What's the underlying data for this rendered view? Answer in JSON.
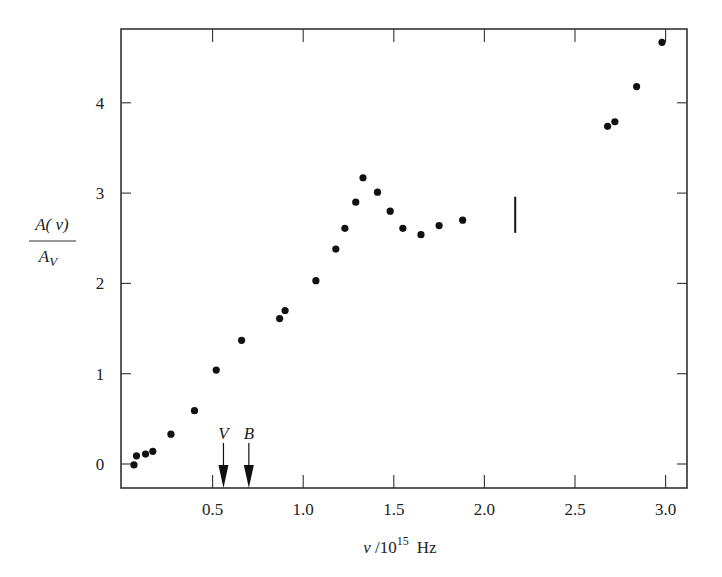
{
  "chart_data": {
    "type": "scatter",
    "title": "",
    "xlabel": "ν /10^15 Hz",
    "xlabel_parts": {
      "symbol": "ν",
      "sep": " /10",
      "exp": "15",
      "unit": "Hz"
    },
    "ylabel": "A(ν)/A_V",
    "ylabel_parts": {
      "numerator": "A( ν)",
      "denominator_main": "A",
      "denominator_sub": "V"
    },
    "xlim": [
      0.0,
      3.1
    ],
    "ylim": [
      -0.27,
      4.84
    ],
    "grid": false,
    "legend": null,
    "x_ticks": [
      0.5,
      1.0,
      1.5,
      2.0,
      2.5,
      3.0
    ],
    "x_tick_labels": [
      "0.5",
      "1.0",
      "1.5",
      "2.0",
      "2.5",
      "3.0"
    ],
    "y_ticks": [
      0,
      1,
      2,
      3,
      4
    ],
    "y_tick_labels": [
      "0",
      "1",
      "2",
      "3",
      "4"
    ],
    "series": [
      {
        "name": "extinction",
        "marker": "filled-circle",
        "points": [
          {
            "x": 0.066,
            "y": -0.01
          },
          {
            "x": 0.08,
            "y": 0.09
          },
          {
            "x": 0.13,
            "y": 0.11
          },
          {
            "x": 0.17,
            "y": 0.14
          },
          {
            "x": 0.27,
            "y": 0.33
          },
          {
            "x": 0.4,
            "y": 0.59
          },
          {
            "x": 0.52,
            "y": 1.04
          },
          {
            "x": 0.66,
            "y": 1.37
          },
          {
            "x": 0.87,
            "y": 1.61
          },
          {
            "x": 0.9,
            "y": 1.7
          },
          {
            "x": 1.07,
            "y": 2.03
          },
          {
            "x": 1.18,
            "y": 2.38
          },
          {
            "x": 1.23,
            "y": 2.61
          },
          {
            "x": 1.29,
            "y": 2.9
          },
          {
            "x": 1.33,
            "y": 3.17
          },
          {
            "x": 1.41,
            "y": 3.01
          },
          {
            "x": 1.48,
            "y": 2.8
          },
          {
            "x": 1.55,
            "y": 2.61
          },
          {
            "x": 1.65,
            "y": 2.54
          },
          {
            "x": 1.75,
            "y": 2.64
          },
          {
            "x": 1.88,
            "y": 2.7
          },
          {
            "x": 2.68,
            "y": 3.74
          },
          {
            "x": 2.72,
            "y": 3.79
          },
          {
            "x": 2.84,
            "y": 4.18
          },
          {
            "x": 2.98,
            "y": 4.67
          }
        ]
      }
    ],
    "range_bars": [
      {
        "x": 2.17,
        "y_low": 2.56,
        "y_high": 2.96
      }
    ],
    "annotations": [
      {
        "label": "V",
        "x": 0.56,
        "type": "down-arrow"
      },
      {
        "label": "B",
        "x": 0.7,
        "type": "down-arrow"
      }
    ]
  },
  "colors": {
    "ink": "#111111",
    "frame": "#333333",
    "background": "#ffffff"
  }
}
